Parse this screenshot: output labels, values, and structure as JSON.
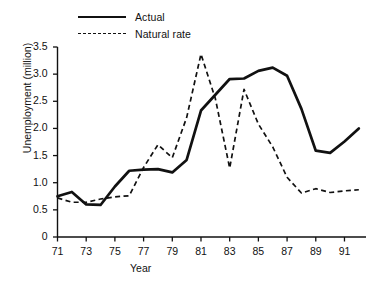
{
  "chart_data": {
    "type": "line",
    "title": "",
    "xlabel": "Year",
    "ylabel": "Unemployment (million)",
    "xlim": [
      71,
      92.5
    ],
    "ylim": [
      0,
      3.5
    ],
    "grid": false,
    "legend_position": "top-left",
    "x_ticks": [
      "71",
      "73",
      "75",
      "77",
      "79",
      "81",
      "83",
      "85",
      "87",
      "89",
      "91"
    ],
    "x_tick_values": [
      71,
      73,
      75,
      77,
      79,
      81,
      83,
      85,
      87,
      89,
      91
    ],
    "y_ticks": [
      "0",
      "0.5",
      "1.0",
      "1.5",
      "2.0",
      "2.5",
      "3.0",
      "3.5"
    ],
    "y_tick_values": [
      0,
      0.5,
      1.0,
      1.5,
      2.0,
      2.5,
      3.0,
      3.5
    ],
    "x": [
      71,
      72,
      73,
      74,
      75,
      76,
      77,
      78,
      79,
      80,
      81,
      82,
      83,
      84,
      85,
      86,
      87,
      88,
      89,
      90,
      91,
      92
    ],
    "series": [
      {
        "name": "Actual",
        "style": "solid",
        "color": "#111111",
        "values": [
          0.75,
          0.83,
          0.6,
          0.59,
          0.93,
          1.22,
          1.24,
          1.25,
          1.19,
          1.42,
          2.33,
          2.62,
          2.91,
          2.92,
          3.06,
          3.12,
          2.97,
          2.36,
          1.59,
          1.55,
          1.76,
          2.0
        ]
      },
      {
        "name": "Natural rate",
        "style": "dashed",
        "color": "#111111",
        "values": [
          0.72,
          0.64,
          0.64,
          0.7,
          0.74,
          0.76,
          1.28,
          1.7,
          1.46,
          2.2,
          3.37,
          2.55,
          1.27,
          2.72,
          2.08,
          1.66,
          1.1,
          0.81,
          0.89,
          0.82,
          0.85,
          0.87
        ]
      }
    ]
  },
  "legend": {
    "items": [
      {
        "label": "Actual",
        "style": "solid"
      },
      {
        "label": "Natural rate",
        "style": "dashed"
      }
    ]
  },
  "axes": {
    "x_title": "Year",
    "y_title": "Unemployment (million)"
  }
}
